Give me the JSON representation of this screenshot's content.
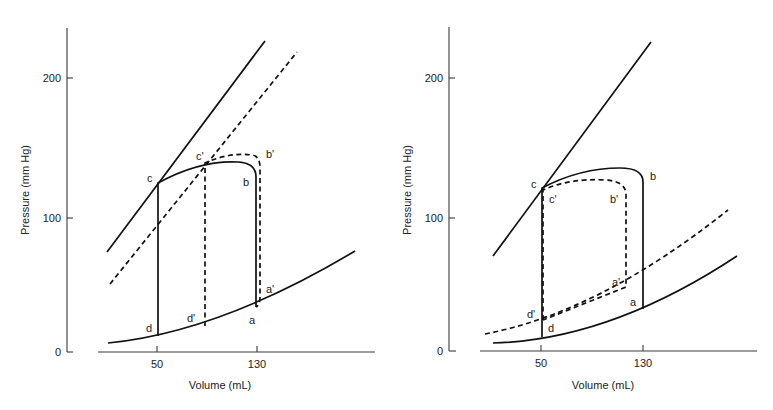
{
  "panels": [
    {
      "id": "left",
      "y_axis_title": "Pressure (mm Hg)",
      "x_axis_title": "Volume (mL)",
      "y_ticks": [
        "200",
        "100",
        "0"
      ],
      "x_ticks": [
        "50",
        "130"
      ],
      "labels": {
        "c": "c",
        "c_prime": "c'",
        "b": "b",
        "b_prime": "b'",
        "a": "a",
        "a_prime": "a'",
        "d": "d",
        "d_prime": "d'"
      }
    },
    {
      "id": "right",
      "y_axis_title": "Pressure (mm Hg)",
      "x_axis_title": "Volume (mL)",
      "y_ticks": [
        "200",
        "100",
        "0"
      ],
      "x_ticks": [
        "50",
        "130"
      ],
      "labels": {
        "c": "c",
        "c_prime": "c'",
        "b": "b",
        "b_prime": "b'",
        "a": "a",
        "a_prime": "a'",
        "d": "d",
        "d_prime": "d'"
      }
    }
  ],
  "colors": {
    "line": "#111111",
    "axis": "#3a3a3a",
    "background": "#ffffff"
  }
}
